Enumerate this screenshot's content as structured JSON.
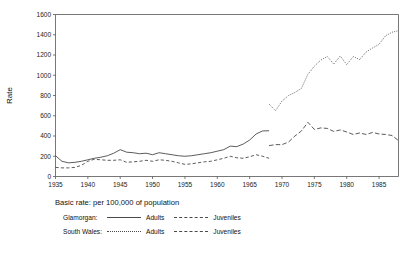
{
  "chart_data": {
    "type": "line",
    "title": "",
    "subtitle": "",
    "xlabel": "",
    "ylabel": "Rate",
    "xlim": [
      1935,
      1988
    ],
    "ylim": [
      0,
      1600
    ],
    "yticks": [
      0,
      200,
      400,
      600,
      800,
      1000,
      1200,
      1400,
      1600
    ],
    "xticks": [
      1935,
      1940,
      1945,
      1950,
      1955,
      1960,
      1965,
      1970,
      1975,
      1980,
      1985
    ],
    "grid": false,
    "legend_position": "below-plot",
    "note": "Basic rate: per 100,000 of population",
    "series": [
      {
        "name": "Glamorgan: Adults",
        "style": "solid",
        "x": [
          1935,
          1936,
          1937,
          1938,
          1939,
          1940,
          1941,
          1942,
          1943,
          1944,
          1945,
          1946,
          1947,
          1948,
          1949,
          1950,
          1951,
          1952,
          1953,
          1954,
          1955,
          1956,
          1957,
          1958,
          1959,
          1960,
          1961,
          1962,
          1963,
          1964,
          1965,
          1966,
          1967,
          1968
        ],
        "values": [
          205,
          150,
          135,
          140,
          150,
          165,
          180,
          190,
          205,
          230,
          265,
          240,
          235,
          225,
          230,
          215,
          235,
          225,
          215,
          205,
          200,
          205,
          215,
          225,
          235,
          250,
          265,
          300,
          295,
          320,
          360,
          420,
          450,
          452
        ]
      },
      {
        "name": "Glamorgan: Juveniles",
        "style": "dashed",
        "x": [
          1935,
          1936,
          1937,
          1938,
          1939,
          1940,
          1941,
          1942,
          1943,
          1944,
          1945,
          1946,
          1947,
          1948,
          1949,
          1950,
          1951,
          1952,
          1953,
          1954,
          1955,
          1956,
          1957,
          1958,
          1959,
          1960,
          1961,
          1962,
          1963,
          1964,
          1965,
          1966,
          1967,
          1968
        ],
        "values": [
          90,
          85,
          85,
          90,
          110,
          150,
          170,
          165,
          160,
          160,
          165,
          140,
          145,
          150,
          160,
          150,
          165,
          160,
          150,
          135,
          120,
          125,
          135,
          145,
          150,
          165,
          180,
          200,
          185,
          180,
          195,
          215,
          200,
          180
        ]
      },
      {
        "name": "South Wales: Adults",
        "style": "dotted",
        "x": [
          1968,
          1969,
          1970,
          1971,
          1972,
          1973,
          1974,
          1975,
          1976,
          1977,
          1978,
          1979,
          1980,
          1981,
          1982,
          1983,
          1984,
          1985,
          1986,
          1987,
          1988
        ],
        "values": [
          715,
          650,
          745,
          800,
          830,
          870,
          1010,
          1090,
          1150,
          1185,
          1110,
          1190,
          1105,
          1185,
          1155,
          1230,
          1270,
          1305,
          1390,
          1425,
          1440
        ]
      },
      {
        "name": "South Wales: Juveniles",
        "style": "dash-dot",
        "x": [
          1968,
          1969,
          1970,
          1971,
          1972,
          1973,
          1974,
          1975,
          1976,
          1977,
          1978,
          1979,
          1980,
          1981,
          1982,
          1983,
          1984,
          1985,
          1986,
          1987,
          1988
        ],
        "values": [
          305,
          315,
          315,
          340,
          400,
          450,
          535,
          465,
          480,
          475,
          445,
          460,
          440,
          415,
          430,
          415,
          435,
          420,
          415,
          405,
          355
        ]
      }
    ]
  },
  "note_line": "Basic rate: per 100,000 of population",
  "legend": {
    "rows": [
      {
        "label": "Glamorgan:",
        "entry1": "Adults",
        "entry1_style": "solid",
        "entry2": "Juveniles",
        "entry2_style": "dashed"
      },
      {
        "label": "South Wales:",
        "entry1": "Adults",
        "entry1_style": "dotted",
        "entry2": "Juveniles",
        "entry2_style": "dash-dot"
      }
    ]
  },
  "axis": {
    "ylabel": "Rate",
    "ytick_labels": [
      "1600",
      "1400",
      "1200",
      "1000",
      "800",
      "600",
      "400",
      "200",
      "0"
    ],
    "xtick_labels": [
      "1935",
      "1940",
      "1945",
      "1950",
      "1955",
      "1960",
      "1965",
      "1970",
      "1975",
      "1980",
      "1985"
    ]
  },
  "colors": {
    "line": "#4a4a4a",
    "axis": "#555555",
    "text": "#111111",
    "background": "#ffffff"
  }
}
